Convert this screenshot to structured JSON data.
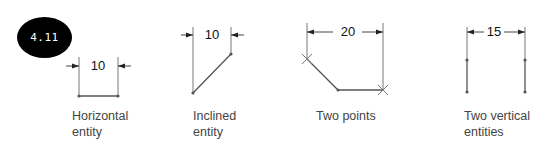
{
  "figure": {
    "badge": "4.11",
    "panels": [
      {
        "id": "horizontal",
        "dimension": "10",
        "caption": "Horizontal\nentity"
      },
      {
        "id": "inclined",
        "dimension": "10",
        "caption": "Inclined\nentity"
      },
      {
        "id": "two-points",
        "dimension": "20",
        "caption": "Two points"
      },
      {
        "id": "two-vertical",
        "dimension": "15",
        "caption": "Two vertical\nentities"
      }
    ]
  }
}
